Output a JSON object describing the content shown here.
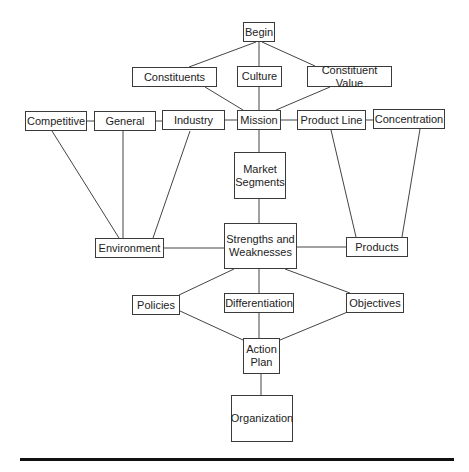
{
  "diagram": {
    "nodes": [
      {
        "id": "begin",
        "label": "Begin",
        "x": 243,
        "y": 22,
        "w": 32,
        "h": 20
      },
      {
        "id": "constituents",
        "label": "Constituents",
        "x": 132,
        "y": 67,
        "w": 85,
        "h": 20
      },
      {
        "id": "culture",
        "label": "Culture",
        "x": 237,
        "y": 66,
        "w": 45,
        "h": 21
      },
      {
        "id": "constituent_value",
        "label": "Constituent Value",
        "x": 307,
        "y": 66,
        "w": 85,
        "h": 21
      },
      {
        "id": "competitive",
        "label": "Competitive",
        "x": 25,
        "y": 111,
        "w": 62,
        "h": 20
      },
      {
        "id": "general",
        "label": "General",
        "x": 94,
        "y": 111,
        "w": 62,
        "h": 20
      },
      {
        "id": "industry",
        "label": "Industry",
        "x": 162,
        "y": 110,
        "w": 63,
        "h": 20
      },
      {
        "id": "mission",
        "label": "Mission",
        "x": 237,
        "y": 110,
        "w": 44,
        "h": 20
      },
      {
        "id": "product_line",
        "label": "Product Line",
        "x": 297,
        "y": 110,
        "w": 69,
        "h": 20
      },
      {
        "id": "concentration",
        "label": "Concentration",
        "x": 373,
        "y": 109,
        "w": 72,
        "h": 20
      },
      {
        "id": "market_segments",
        "label": "Market\nSegments",
        "x": 234,
        "y": 152,
        "w": 52,
        "h": 47
      },
      {
        "id": "environment",
        "label": "Environment",
        "x": 95,
        "y": 238,
        "w": 69,
        "h": 20
      },
      {
        "id": "strengths_weaknesses",
        "label": "Strengths and\nWeaknesses",
        "x": 224,
        "y": 223,
        "w": 73,
        "h": 46
      },
      {
        "id": "products",
        "label": "Products",
        "x": 346,
        "y": 237,
        "w": 62,
        "h": 20
      },
      {
        "id": "policies",
        "label": "Policies",
        "x": 132,
        "y": 295,
        "w": 48,
        "h": 20
      },
      {
        "id": "differentiation",
        "label": "Differentiation",
        "x": 224,
        "y": 293,
        "w": 70,
        "h": 20
      },
      {
        "id": "objectives",
        "label": "Objectives",
        "x": 346,
        "y": 293,
        "w": 58,
        "h": 20
      },
      {
        "id": "action_plan",
        "label": "Action\nPlan",
        "x": 243,
        "y": 338,
        "w": 37,
        "h": 36
      },
      {
        "id": "organization",
        "label": "Organization",
        "x": 231,
        "y": 395,
        "w": 62,
        "h": 47
      }
    ],
    "edges": [
      [
        256,
        42,
        189,
        67
      ],
      [
        259,
        42,
        259,
        66
      ],
      [
        262,
        42,
        315,
        66
      ],
      [
        205,
        87,
        243,
        110
      ],
      [
        259,
        87,
        259,
        110
      ],
      [
        330,
        87,
        276,
        110
      ],
      [
        87,
        121,
        94,
        121
      ],
      [
        156,
        121,
        162,
        121
      ],
      [
        225,
        120,
        237,
        120
      ],
      [
        281,
        120,
        297,
        120
      ],
      [
        366,
        120,
        373,
        120
      ],
      [
        52,
        131,
        119,
        238
      ],
      [
        123,
        131,
        123,
        238
      ],
      [
        190,
        131,
        153,
        238
      ],
      [
        259,
        130,
        259,
        152
      ],
      [
        259,
        199,
        259,
        223
      ],
      [
        164,
        248,
        224,
        248
      ],
      [
        297,
        247,
        346,
        247
      ],
      [
        331,
        130,
        356,
        237
      ],
      [
        420,
        129,
        402,
        237
      ],
      [
        234,
        269,
        179,
        295
      ],
      [
        259,
        269,
        259,
        293
      ],
      [
        285,
        269,
        350,
        293
      ],
      [
        180,
        311,
        243,
        340
      ],
      [
        259,
        313,
        259,
        338
      ],
      [
        350,
        311,
        280,
        340
      ],
      [
        261,
        374,
        261,
        395
      ]
    ]
  }
}
